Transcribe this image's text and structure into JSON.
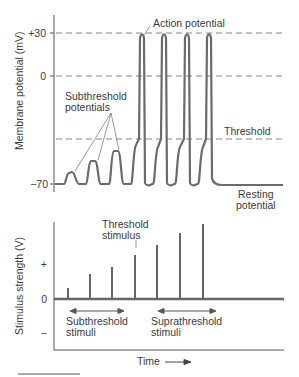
{
  "top_chart": {
    "ylabel": "Membrane potential (mV)",
    "ticks": {
      "plus30": "+30",
      "zero": "0",
      "minus70": "−70"
    },
    "labels": {
      "action_potential": "Action potential",
      "subthreshold_line1": "Subthreshold",
      "subthreshold_line2": "potentials",
      "threshold": "Threshold",
      "resting_line1": "Resting",
      "resting_line2": "potential"
    }
  },
  "bottom_chart": {
    "ylabel": "Stimulus strength (V)",
    "ticks": {
      "plus": "+",
      "zero": "0",
      "minus": "−"
    },
    "labels": {
      "threshold_stimulus_line1": "Threshold",
      "threshold_stimulus_line2": "stimulus",
      "subthreshold_line1": "Subthreshold",
      "subthreshold_line2": "stimuli",
      "suprathreshold_line1": "Suprathreshold",
      "suprathreshold_line2": "stimuli",
      "xlabel": "Time"
    }
  },
  "colors": {
    "trace": "#6b6b6b",
    "axis": "#555555",
    "dash": "#777777",
    "text": "#3a3a3a"
  }
}
